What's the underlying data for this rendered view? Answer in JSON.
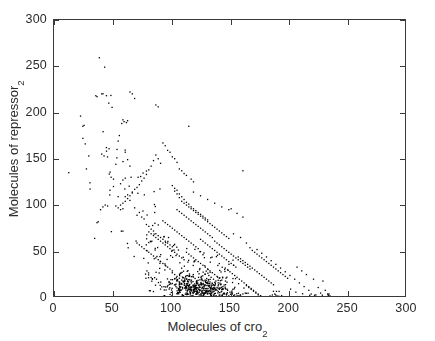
{
  "chart_data": {
    "type": "scatter",
    "title": "",
    "xlabel": "Molecules of cro",
    "xlabel_sub": "2",
    "ylabel": "Molecules of repressor",
    "ylabel_sub": "2",
    "xlim": [
      0,
      300
    ],
    "ylim": [
      0,
      300
    ],
    "xticks": [
      0,
      50,
      100,
      150,
      200,
      250,
      300
    ],
    "yticks": [
      0,
      50,
      100,
      150,
      200,
      250,
      300
    ],
    "xtick_labels": [
      "0",
      "50",
      "100",
      "150",
      "200",
      "250",
      "300"
    ],
    "ytick_labels": [
      "0",
      "50",
      "100",
      "150",
      "200",
      "250",
      "300"
    ],
    "grid": false,
    "legend": null,
    "marker": "dot",
    "marker_size_px": 1.6,
    "marker_color": "#000000",
    "n_points": 1000,
    "points": [
      [
        12,
        136
      ],
      [
        22,
        197
      ],
      [
        24,
        186
      ],
      [
        25,
        187
      ],
      [
        24,
        173
      ],
      [
        26,
        167
      ],
      [
        27,
        140
      ],
      [
        29,
        154
      ],
      [
        30,
        125
      ],
      [
        35,
        219
      ],
      [
        36,
        218
      ],
      [
        38,
        260
      ],
      [
        40,
        221
      ],
      [
        44,
        219
      ],
      [
        46,
        211
      ],
      [
        40,
        156
      ],
      [
        42,
        154
      ],
      [
        44,
        163
      ],
      [
        48,
        131
      ],
      [
        50,
        129
      ],
      [
        52,
        145
      ],
      [
        54,
        170
      ],
      [
        55,
        176
      ],
      [
        53,
        161
      ],
      [
        57,
        189
      ],
      [
        59,
        191
      ],
      [
        61,
        190
      ],
      [
        62,
        192
      ],
      [
        58,
        193
      ],
      [
        64,
        223
      ],
      [
        66,
        221
      ],
      [
        68,
        216
      ],
      [
        60,
        158
      ],
      [
        62,
        150
      ],
      [
        64,
        143
      ],
      [
        56,
        124
      ],
      [
        58,
        128
      ],
      [
        60,
        130
      ],
      [
        50,
        121
      ],
      [
        47,
        117
      ],
      [
        45,
        100
      ],
      [
        43,
        101
      ],
      [
        41,
        99
      ],
      [
        39,
        96
      ],
      [
        37,
        83
      ],
      [
        36,
        82
      ],
      [
        34,
        65
      ],
      [
        52,
        100
      ],
      [
        54,
        98
      ],
      [
        56,
        96
      ],
      [
        58,
        97
      ],
      [
        60,
        110
      ],
      [
        62,
        112
      ],
      [
        64,
        106
      ],
      [
        66,
        115
      ],
      [
        68,
        98
      ],
      [
        70,
        90
      ],
      [
        72,
        93
      ],
      [
        74,
        88
      ],
      [
        76,
        86
      ],
      [
        78,
        80
      ],
      [
        80,
        78
      ],
      [
        82,
        75
      ],
      [
        84,
        73
      ],
      [
        86,
        70
      ],
      [
        88,
        68
      ],
      [
        90,
        66
      ],
      [
        92,
        64
      ],
      [
        94,
        62
      ],
      [
        96,
        60
      ],
      [
        98,
        58
      ],
      [
        100,
        56
      ],
      [
        86,
        209
      ],
      [
        88,
        207
      ],
      [
        92,
        168
      ],
      [
        94,
        165
      ],
      [
        96,
        160
      ],
      [
        98,
        158
      ],
      [
        100,
        153
      ],
      [
        102,
        151
      ],
      [
        104,
        147
      ],
      [
        106,
        140
      ],
      [
        108,
        138
      ],
      [
        110,
        135
      ],
      [
        112,
        133
      ],
      [
        114,
        186
      ],
      [
        116,
        129
      ],
      [
        118,
        126
      ],
      [
        90,
        146
      ],
      [
        88,
        151
      ],
      [
        86,
        155
      ],
      [
        84,
        149
      ],
      [
        82,
        143
      ],
      [
        80,
        139
      ],
      [
        78,
        134
      ],
      [
        76,
        130
      ],
      [
        74,
        127
      ],
      [
        72,
        123
      ],
      [
        70,
        120
      ],
      [
        68,
        118
      ],
      [
        66,
        114
      ],
      [
        64,
        111
      ],
      [
        62,
        108
      ],
      [
        60,
        105
      ],
      [
        58,
        103
      ],
      [
        56,
        101
      ],
      [
        100,
        122
      ],
      [
        102,
        119
      ],
      [
        104,
        117
      ],
      [
        106,
        113
      ],
      [
        108,
        110
      ],
      [
        110,
        107
      ],
      [
        112,
        104
      ],
      [
        114,
        102
      ],
      [
        116,
        99
      ],
      [
        118,
        97
      ],
      [
        120,
        95
      ],
      [
        122,
        93
      ],
      [
        124,
        91
      ],
      [
        126,
        89
      ],
      [
        128,
        87
      ],
      [
        130,
        85
      ],
      [
        104,
        96
      ],
      [
        106,
        94
      ],
      [
        108,
        92
      ],
      [
        110,
        90
      ],
      [
        112,
        88
      ],
      [
        114,
        86
      ],
      [
        116,
        84
      ],
      [
        118,
        82
      ],
      [
        120,
        80
      ],
      [
        122,
        78
      ],
      [
        124,
        76
      ],
      [
        126,
        74
      ],
      [
        128,
        72
      ],
      [
        130,
        70
      ],
      [
        132,
        68
      ],
      [
        134,
        66
      ],
      [
        92,
        84
      ],
      [
        94,
        82
      ],
      [
        96,
        80
      ],
      [
        98,
        78
      ],
      [
        100,
        76
      ],
      [
        102,
        74
      ],
      [
        104,
        72
      ],
      [
        106,
        70
      ],
      [
        108,
        68
      ],
      [
        110,
        66
      ],
      [
        112,
        64
      ],
      [
        114,
        62
      ],
      [
        116,
        60
      ],
      [
        118,
        58
      ],
      [
        120,
        56
      ],
      [
        122,
        54
      ],
      [
        80,
        72
      ],
      [
        82,
        70
      ],
      [
        84,
        68
      ],
      [
        86,
        66
      ],
      [
        88,
        64
      ],
      [
        90,
        62
      ],
      [
        92,
        60
      ],
      [
        94,
        58
      ],
      [
        96,
        56
      ],
      [
        98,
        54
      ],
      [
        100,
        52
      ],
      [
        102,
        50
      ],
      [
        104,
        48
      ],
      [
        106,
        46
      ],
      [
        108,
        44
      ],
      [
        110,
        42
      ],
      [
        70,
        60
      ],
      [
        72,
        58
      ],
      [
        74,
        56
      ],
      [
        76,
        54
      ],
      [
        78,
        52
      ],
      [
        80,
        50
      ],
      [
        82,
        48
      ],
      [
        84,
        46
      ],
      [
        86,
        44
      ],
      [
        88,
        42
      ],
      [
        90,
        40
      ],
      [
        92,
        38
      ],
      [
        94,
        36
      ],
      [
        96,
        34
      ],
      [
        98,
        32
      ],
      [
        100,
        30
      ],
      [
        112,
        50
      ],
      [
        114,
        48
      ],
      [
        116,
        46
      ],
      [
        118,
        44
      ],
      [
        120,
        42
      ],
      [
        122,
        40
      ],
      [
        124,
        38
      ],
      [
        126,
        36
      ],
      [
        128,
        34
      ],
      [
        130,
        32
      ],
      [
        132,
        30
      ],
      [
        134,
        28
      ],
      [
        136,
        26
      ],
      [
        138,
        24
      ],
      [
        140,
        22
      ],
      [
        142,
        20
      ],
      [
        124,
        64
      ],
      [
        126,
        62
      ],
      [
        128,
        60
      ],
      [
        130,
        58
      ],
      [
        132,
        56
      ],
      [
        134,
        54
      ],
      [
        136,
        52
      ],
      [
        138,
        50
      ],
      [
        140,
        48
      ],
      [
        142,
        46
      ],
      [
        144,
        44
      ],
      [
        146,
        42
      ],
      [
        148,
        40
      ],
      [
        150,
        38
      ],
      [
        152,
        36
      ],
      [
        154,
        34
      ],
      [
        136,
        62
      ],
      [
        138,
        60
      ],
      [
        140,
        58
      ],
      [
        142,
        56
      ],
      [
        144,
        54
      ],
      [
        146,
        52
      ],
      [
        148,
        50
      ],
      [
        150,
        48
      ],
      [
        152,
        46
      ],
      [
        154,
        44
      ],
      [
        156,
        42
      ],
      [
        158,
        40
      ],
      [
        160,
        38
      ],
      [
        162,
        36
      ],
      [
        164,
        34
      ],
      [
        166,
        32
      ],
      [
        100,
        28
      ],
      [
        102,
        26
      ],
      [
        104,
        24
      ],
      [
        106,
        22
      ],
      [
        108,
        20
      ],
      [
        110,
        18
      ],
      [
        112,
        16
      ],
      [
        114,
        14
      ],
      [
        116,
        12
      ],
      [
        118,
        10
      ],
      [
        120,
        8
      ],
      [
        122,
        6
      ],
      [
        124,
        4
      ],
      [
        126,
        3
      ],
      [
        128,
        2
      ],
      [
        130,
        1
      ],
      [
        132,
        18
      ],
      [
        134,
        16
      ],
      [
        136,
        14
      ],
      [
        138,
        12
      ],
      [
        140,
        10
      ],
      [
        142,
        8
      ],
      [
        144,
        6
      ],
      [
        146,
        4
      ],
      [
        148,
        3
      ],
      [
        150,
        2
      ],
      [
        152,
        1
      ],
      [
        154,
        2
      ],
      [
        156,
        3
      ],
      [
        158,
        4
      ],
      [
        160,
        5
      ],
      [
        162,
        6
      ],
      [
        131,
        25
      ],
      [
        133,
        23
      ],
      [
        135,
        21
      ],
      [
        137,
        19
      ],
      [
        139,
        17
      ],
      [
        141,
        15
      ],
      [
        143,
        13
      ],
      [
        145,
        11
      ],
      [
        147,
        9
      ],
      [
        149,
        7
      ],
      [
        151,
        5
      ],
      [
        153,
        4
      ],
      [
        155,
        3
      ],
      [
        157,
        2
      ],
      [
        159,
        1
      ],
      [
        161,
        2
      ],
      [
        163,
        14
      ],
      [
        165,
        12
      ],
      [
        167,
        10
      ],
      [
        169,
        8
      ],
      [
        171,
        6
      ],
      [
        173,
        4
      ],
      [
        175,
        3
      ],
      [
        177,
        2
      ],
      [
        179,
        1
      ],
      [
        181,
        2
      ],
      [
        183,
        3
      ],
      [
        185,
        4
      ],
      [
        187,
        5
      ],
      [
        189,
        3
      ],
      [
        191,
        2
      ],
      [
        193,
        1
      ],
      [
        145,
        33
      ],
      [
        147,
        31
      ],
      [
        149,
        29
      ],
      [
        151,
        27
      ],
      [
        153,
        25
      ],
      [
        155,
        23
      ],
      [
        157,
        21
      ],
      [
        159,
        19
      ],
      [
        161,
        17
      ],
      [
        163,
        15
      ],
      [
        165,
        13
      ],
      [
        167,
        11
      ],
      [
        169,
        9
      ],
      [
        171,
        7
      ],
      [
        173,
        5
      ],
      [
        175,
        3
      ],
      [
        156,
        45
      ],
      [
        158,
        43
      ],
      [
        160,
        41
      ],
      [
        162,
        39
      ],
      [
        164,
        37
      ],
      [
        166,
        35
      ],
      [
        168,
        33
      ],
      [
        170,
        31
      ],
      [
        172,
        29
      ],
      [
        174,
        27
      ],
      [
        176,
        25
      ],
      [
        178,
        23
      ],
      [
        180,
        21
      ],
      [
        182,
        19
      ],
      [
        184,
        17
      ],
      [
        186,
        15
      ],
      [
        168,
        52
      ],
      [
        170,
        50
      ],
      [
        172,
        48
      ],
      [
        174,
        46
      ],
      [
        176,
        44
      ],
      [
        178,
        42
      ],
      [
        180,
        40
      ],
      [
        182,
        38
      ],
      [
        184,
        36
      ],
      [
        186,
        34
      ],
      [
        188,
        32
      ],
      [
        190,
        30
      ],
      [
        192,
        28
      ],
      [
        194,
        26
      ],
      [
        196,
        24
      ],
      [
        198,
        22
      ],
      [
        150,
        97
      ],
      [
        155,
        92
      ],
      [
        160,
        88
      ],
      [
        152,
        70
      ],
      [
        158,
        66
      ],
      [
        163,
        60
      ],
      [
        166,
        55
      ],
      [
        172,
        53
      ],
      [
        176,
        49
      ],
      [
        180,
        45
      ],
      [
        184,
        41
      ],
      [
        188,
        37
      ],
      [
        192,
        33
      ],
      [
        196,
        29
      ],
      [
        200,
        25
      ],
      [
        204,
        21
      ],
      [
        160,
        138
      ],
      [
        148,
        96
      ],
      [
        142,
        99
      ],
      [
        136,
        103
      ],
      [
        130,
        107
      ],
      [
        124,
        111
      ],
      [
        118,
        115
      ],
      [
        206,
        34
      ],
      [
        210,
        30
      ],
      [
        214,
        26
      ],
      [
        208,
        17
      ],
      [
        212,
        13
      ],
      [
        216,
        9
      ],
      [
        220,
        21
      ],
      [
        224,
        12
      ],
      [
        228,
        19
      ],
      [
        230,
        9
      ],
      [
        232,
        5
      ],
      [
        234,
        3
      ],
      [
        218,
        5
      ],
      [
        222,
        4
      ],
      [
        226,
        6
      ],
      [
        205,
        7
      ],
      [
        118,
        95
      ],
      [
        120,
        93
      ],
      [
        122,
        91
      ],
      [
        124,
        89
      ],
      [
        126,
        87
      ],
      [
        128,
        85
      ],
      [
        130,
        83
      ],
      [
        132,
        81
      ],
      [
        134,
        79
      ],
      [
        136,
        77
      ],
      [
        138,
        75
      ],
      [
        140,
        73
      ],
      [
        142,
        71
      ],
      [
        144,
        69
      ],
      [
        146,
        67
      ],
      [
        148,
        65
      ],
      [
        108,
        105
      ],
      [
        110,
        103
      ],
      [
        112,
        101
      ],
      [
        114,
        99
      ],
      [
        116,
        97
      ],
      [
        106,
        109
      ],
      [
        104,
        113
      ],
      [
        102,
        116
      ]
    ]
  }
}
